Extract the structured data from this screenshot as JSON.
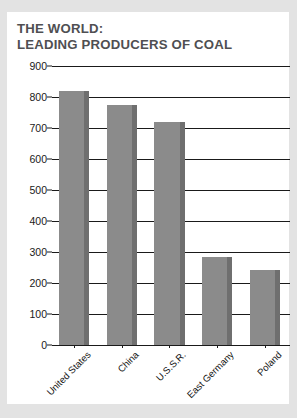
{
  "title": {
    "line1": "THE WORLD:",
    "line2": "LEADING PRODUCERS OF COAL",
    "color": "#4f4f52"
  },
  "colors": {
    "page_background": "#e3e3e3",
    "card_background": "#ffffff",
    "bar_fill": "#8b8b8b",
    "bar_shadow": "#6f6f6f",
    "axis": "#1a1a1a",
    "title": "#4f4f52"
  },
  "chart_data": {
    "type": "bar",
    "title": "THE WORLD: LEADING PRODUCERS OF COAL",
    "categories": [
      "United States",
      "China",
      "U.S.S.R.",
      "East Germany",
      "Poland"
    ],
    "values": [
      820,
      775,
      720,
      283,
      243
    ],
    "xlabel": "",
    "ylabel": "Millions of Metric Tons",
    "ylim": [
      0,
      900
    ],
    "ytick_step": 100,
    "yticks": [
      0,
      100,
      200,
      300,
      400,
      500,
      600,
      700,
      800,
      900
    ],
    "ytick_labels": [
      "0",
      "100",
      "200",
      "300",
      "400",
      "500",
      "600",
      "700",
      "800",
      "900"
    ],
    "grid": true,
    "grid_axis": "y",
    "legend": false,
    "legend_position": "none",
    "series": [
      {
        "name": "Coal production",
        "values": [
          820,
          775,
          720,
          283,
          243
        ]
      }
    ],
    "label_rotation": -45
  }
}
